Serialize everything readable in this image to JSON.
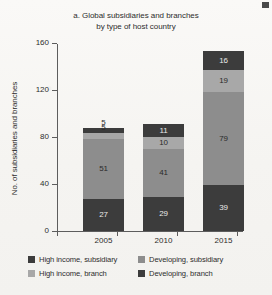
{
  "chart_data": {
    "type": "bar",
    "subtype": "stacked-bar",
    "title": "a. Global subsidiaries and branches by type of host country",
    "title_line1": "a. Global subsidiaries and branches",
    "title_line2": "by type of host country",
    "xlabel": "",
    "ylabel": "No. of subsidiaries and branches",
    "categories": [
      "2005",
      "2010",
      "2015"
    ],
    "ylim": [
      0,
      160
    ],
    "yticks": [
      0,
      40,
      80,
      120,
      160
    ],
    "ytick_labels": [
      "0",
      "40",
      "80",
      "120",
      "160"
    ],
    "grid": false,
    "legend_position": "bottom",
    "series": [
      {
        "name": "High income, subsidiary",
        "color": "#3c3c3c",
        "values": [
          27,
          29,
          39
        ],
        "labels": [
          "27",
          "29",
          "39"
        ]
      },
      {
        "name": "Developing, subsidiary",
        "color": "#8d8d8d",
        "values": [
          51,
          41,
          79
        ],
        "labels": [
          "51",
          "41",
          "79"
        ]
      },
      {
        "name": "High income, branch",
        "color": "#a8a8a8",
        "values": [
          5,
          10,
          19
        ],
        "labels": [
          "5",
          "10",
          "19"
        ]
      },
      {
        "name": "Developing, branch",
        "color": "#3c3c3c",
        "values": [
          5,
          11,
          16
        ],
        "labels": [
          "5",
          "11",
          "16"
        ]
      }
    ],
    "totals": [
      88,
      91,
      153
    ],
    "annotations": []
  },
  "legend": {
    "items": [
      {
        "label": "High income, subsidiary",
        "color": "#3c3c3c"
      },
      {
        "label": "Developing, subsidiary",
        "color": "#8d8d8d"
      },
      {
        "label": "High income, branch",
        "color": "#a8a8a8"
      },
      {
        "label": "Developing, branch",
        "color": "#3c3c3c"
      }
    ]
  },
  "page": {
    "background": "#f7f6f3",
    "ink": "#2d2d2d"
  }
}
